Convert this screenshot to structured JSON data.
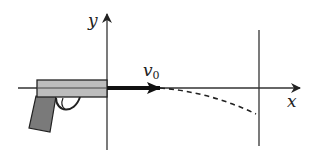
{
  "diagram": {
    "labels": {
      "y_axis": "y",
      "x_axis": "x",
      "velocity": "v",
      "velocity_subscript": "0"
    },
    "colors": {
      "line": "#333333",
      "barrel": "#bdbdbd",
      "grip": "#7a7a7a",
      "arrow": "#111111"
    }
  }
}
